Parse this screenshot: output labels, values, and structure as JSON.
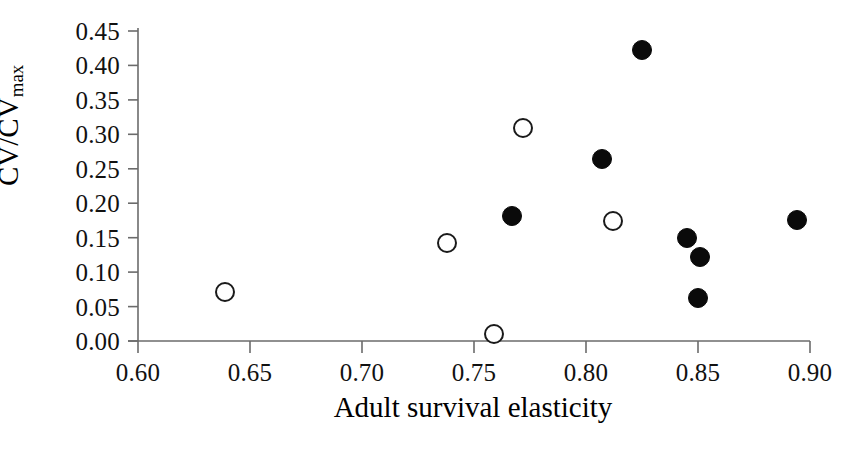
{
  "chart_data": {
    "type": "scatter",
    "title": "",
    "xlabel": "Adult survival elasticity",
    "ylabel": "CV/CV",
    "ylabel_subscript": "max",
    "xlim": [
      0.6,
      0.9
    ],
    "ylim": [
      0.0,
      0.45
    ],
    "grid": false,
    "legend": null,
    "xticks": [
      "0.60",
      "0.65",
      "0.70",
      "0.75",
      "0.80",
      "0.85",
      "0.90"
    ],
    "xtick_values": [
      0.6,
      0.65,
      0.7,
      0.75,
      0.8,
      0.85,
      0.9
    ],
    "yticks": [
      "0.00",
      "0.05",
      "0.10",
      "0.15",
      "0.20",
      "0.25",
      "0.30",
      "0.35",
      "0.40",
      "0.45"
    ],
    "ytick_values": [
      0.0,
      0.05,
      0.1,
      0.15,
      0.2,
      0.25,
      0.3,
      0.35,
      0.4,
      0.45
    ],
    "series": [
      {
        "name": "open-circles",
        "marker": "open-circle",
        "color": "#1a1a1a",
        "points": [
          {
            "x": 0.639,
            "y": 0.071
          },
          {
            "x": 0.738,
            "y": 0.142
          },
          {
            "x": 0.759,
            "y": 0.01
          },
          {
            "x": 0.772,
            "y": 0.309
          },
          {
            "x": 0.812,
            "y": 0.174
          }
        ]
      },
      {
        "name": "filled-circles",
        "marker": "filled-circle",
        "color": "#0a0a0a",
        "points": [
          {
            "x": 0.767,
            "y": 0.181
          },
          {
            "x": 0.807,
            "y": 0.264
          },
          {
            "x": 0.825,
            "y": 0.422
          },
          {
            "x": 0.845,
            "y": 0.149
          },
          {
            "x": 0.851,
            "y": 0.122
          },
          {
            "x": 0.85,
            "y": 0.063
          },
          {
            "x": 0.894,
            "y": 0.176
          }
        ]
      }
    ]
  },
  "axes": {
    "axis_color": "#6b6b6b",
    "plot_left_px": 138,
    "plot_right_px": 810,
    "plot_top_px": 31,
    "plot_bottom_px": 341
  }
}
